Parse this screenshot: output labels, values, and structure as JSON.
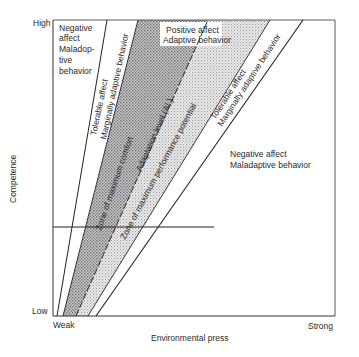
{
  "diagram": {
    "type": "ecological-model-of-adaptation",
    "y_axis": {
      "label": "Competence",
      "high_label": "High",
      "low_label": "Low"
    },
    "x_axis": {
      "label": "Environmental press",
      "weak_label": "Weak",
      "strong_label": "Strong"
    },
    "regions": {
      "left_negative": [
        "Negative",
        "affect",
        "Maladop-",
        "tive",
        "behavior"
      ],
      "left_tolerable": [
        "Tolerable affect",
        "Marginally adaptive behavior"
      ],
      "positive": [
        "Positive affect",
        "Adaptive behavior"
      ],
      "zone_comfort": "Zone of maximum comfort",
      "adaptation_level": "Adaptation level (AL)",
      "zone_performance": "Zone of maximum performance potential",
      "right_tolerable": [
        "Tolerable affect",
        "Marginally adaptive behavior"
      ],
      "right_negative": [
        "Negative affect",
        "Maladaptive behavior"
      ]
    },
    "colors": {
      "line": "#222222",
      "dark_shade": "#a9a9a9",
      "light_shade": "#d4d4d4",
      "background": "#ffffff"
    }
  }
}
